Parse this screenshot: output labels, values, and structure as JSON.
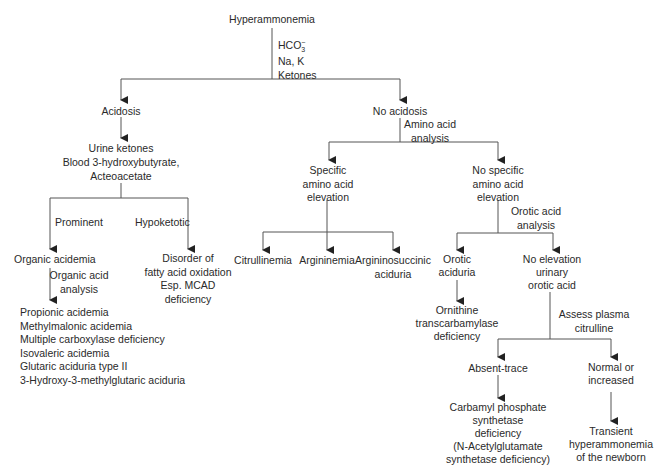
{
  "diagram": {
    "root": "Hyperammonemia",
    "root_tests": [
      "HCO3−",
      "Na, K",
      "Ketones"
    ],
    "acidosis": {
      "label": "Acidosis",
      "tests": [
        "Urine ketones",
        "Blood 3-hydroxybutyrate,",
        "Acteoacetate"
      ],
      "branch_prominent": "Prominent",
      "branch_hypoketotic": "Hypoketotic",
      "organic_acidemia": "Organic acidemia",
      "organic_acid_analysis": [
        "Organic acid",
        "analysis"
      ],
      "organic_acid_list": [
        "Propionic acidemia",
        "Methylmalonic acidemia",
        "Multiple carboxylase deficiency",
        "Isovaleric acidemia",
        "Glutaric aciduria type II",
        "3-Hydroxy-3-methylglutaric aciduria"
      ],
      "fatty_acid": [
        "Disorder of",
        "fatty acid oxidation",
        "Esp. MCAD",
        "deficiency"
      ]
    },
    "no_acidosis": {
      "label": "No acidosis",
      "test": [
        "Amino acid",
        "analysis"
      ],
      "specific": [
        "Specific",
        "amino acid",
        "elevation"
      ],
      "specific_children": [
        "Citrullinemia",
        "Argininemia",
        [
          "Argininosuccinic",
          "aciduria"
        ]
      ],
      "no_specific": [
        "No specific",
        "amino acid",
        "elevation"
      ],
      "orotic_test": [
        "Orotic acid",
        "analysis"
      ],
      "orotic_aciduria": [
        "Orotic",
        "aciduria"
      ],
      "otc": [
        "Ornithine",
        "transcarbamylase",
        "deficiency"
      ],
      "no_elevation": [
        "No elevation",
        "urinary",
        "orotic acid"
      ],
      "citrulline_test": [
        "Assess plasma",
        "citrulline"
      ],
      "absent_trace": "Absent-trace",
      "cps": [
        "Carbamyl phosphate",
        "synthetase",
        "deficiency",
        "(N-Acetylglutamate",
        "synthetase deficiency)"
      ],
      "normal_increased": [
        "Normal or",
        "increased"
      ],
      "transient": [
        "Transient",
        "hyperammonemia",
        "of the newborn"
      ]
    }
  }
}
